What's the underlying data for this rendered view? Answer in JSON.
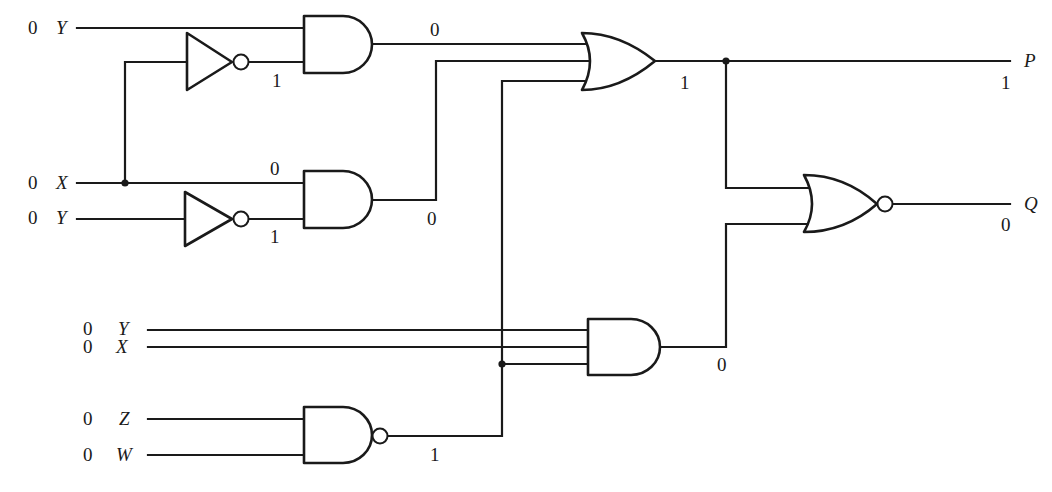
{
  "figure": {
    "type": "logic-circuit",
    "inputs": [
      {
        "id": "in1",
        "name": "Y",
        "value": "0"
      },
      {
        "id": "in2",
        "name": "X",
        "value": "0"
      },
      {
        "id": "in3",
        "name": "Y",
        "value": "0"
      },
      {
        "id": "in4",
        "name": "Y",
        "value": "0"
      },
      {
        "id": "in5",
        "name": "X",
        "value": "0"
      },
      {
        "id": "in6",
        "name": "Z",
        "value": "0"
      },
      {
        "id": "in7",
        "name": "W",
        "value": "0"
      }
    ],
    "gates": [
      {
        "id": "not1",
        "type": "NOT",
        "input": "X",
        "output_value": "1"
      },
      {
        "id": "not2",
        "type": "NOT",
        "input": "Y",
        "output_value": "1"
      },
      {
        "id": "and1",
        "type": "AND",
        "inputs": [
          "Y",
          "NOT X"
        ],
        "output_value": "0"
      },
      {
        "id": "and2",
        "type": "AND",
        "inputs": [
          "X",
          "NOT Y"
        ],
        "output_value": "0",
        "input_label_x": "0"
      },
      {
        "id": "or1",
        "type": "OR",
        "inputs": [
          "and1",
          "and2",
          "nand1"
        ],
        "output_value": "1"
      },
      {
        "id": "nand1",
        "type": "NAND",
        "inputs": [
          "Z",
          "W"
        ],
        "output_value": "1"
      },
      {
        "id": "and3",
        "type": "AND",
        "inputs": [
          "Y",
          "X",
          "nand1"
        ],
        "output_value": "0"
      },
      {
        "id": "nor1",
        "type": "NOR",
        "inputs": [
          "or1",
          "and3"
        ],
        "output_value": "0"
      }
    ],
    "outputs": [
      {
        "id": "outP",
        "name": "P",
        "value": "1"
      },
      {
        "id": "outQ",
        "name": "Q",
        "value": "0"
      }
    ],
    "wire_labels": {
      "not1_out": "1",
      "and1_out": "0",
      "and2_in_x": "0",
      "not2_out": "1",
      "and2_out": "0",
      "or1_out": "1",
      "p_value": "1",
      "q_value": "0",
      "and3_out": "0",
      "nand1_out": "1"
    }
  }
}
